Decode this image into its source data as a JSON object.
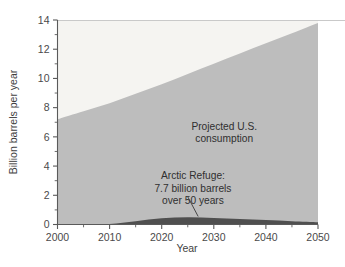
{
  "chart_data": {
    "type": "area",
    "title": "",
    "xlabel": "Year",
    "ylabel": "Billion barrels per year",
    "xlim": [
      2000,
      2050
    ],
    "ylim": [
      0,
      14
    ],
    "grid": false,
    "legend_position": "none",
    "x_ticks": [
      2000,
      2010,
      2020,
      2030,
      2040,
      2050
    ],
    "x_tick_labels": [
      "2000",
      "2010",
      "2020",
      "2030",
      "2040",
      "2050"
    ],
    "x_minor_ticks": [
      2005,
      2015,
      2025,
      2035,
      2045
    ],
    "y_ticks": [
      0,
      2,
      4,
      6,
      8,
      10,
      12,
      14
    ],
    "y_tick_labels": [
      "0",
      "2",
      "4",
      "6",
      "8",
      "10",
      "12",
      "14"
    ],
    "y_minor_ticks": [
      1,
      3,
      5,
      7,
      9,
      11,
      13
    ],
    "x": [
      2000,
      2005,
      2010,
      2015,
      2020,
      2025,
      2030,
      2035,
      2040,
      2045,
      2050
    ],
    "series": [
      {
        "name": "Arctic Refuge",
        "color": "#4f4f4f",
        "values": [
          0.0,
          0.0,
          0.03,
          0.22,
          0.42,
          0.5,
          0.45,
          0.37,
          0.3,
          0.22,
          0.15
        ]
      },
      {
        "name": "Projected U.S. consumption",
        "color": "#bdbdbd",
        "values": [
          7.2,
          7.75,
          8.3,
          8.95,
          9.6,
          10.3,
          11.0,
          11.7,
          12.4,
          13.1,
          13.8
        ]
      }
    ],
    "background_band": {
      "name": "plot-background",
      "color": "#f5f4f1"
    },
    "annotations": [
      {
        "name": "consumption-annotation",
        "lines": [
          "Projected U.S.",
          "consumption"
        ],
        "x": 2032,
        "y": 6.5
      },
      {
        "name": "arctic-refuge-annotation",
        "lines": [
          "Arctic Refuge:",
          "7.7 billion barrels",
          "over 50 years"
        ],
        "x": 2026,
        "y": 3.1,
        "leader_from": [
          2025,
          1.9
        ],
        "leader_to": [
          2027,
          0.55
        ]
      }
    ]
  },
  "axes": {
    "y_axis_title": "Billion barrels per year",
    "x_axis_title": "Year"
  },
  "colors": {
    "consumption_fill": "#bdbdbd",
    "refuge_fill": "#4f4f4f",
    "upper_fill": "#f5f4f1",
    "axis_line": "#5a5a5a",
    "top_rule": "#c9c9c9"
  }
}
